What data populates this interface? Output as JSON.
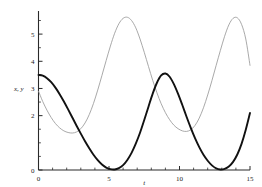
{
  "chart_data": {
    "type": "line",
    "title": "",
    "subtitle": "",
    "xlabel": "t",
    "ylabel": "x, y",
    "xlim": [
      0,
      15
    ],
    "ylim": [
      0,
      5.85
    ],
    "grid": false,
    "legend": null,
    "xticks": [
      0,
      5,
      10,
      15
    ],
    "xtick_labels": [
      "0",
      "5",
      "10",
      "15"
    ],
    "xminor_ticks": [
      1,
      2,
      3,
      4,
      6,
      7,
      8,
      9,
      11,
      12,
      13,
      14
    ],
    "yticks": [
      0,
      2,
      3,
      4,
      5
    ],
    "ytick_labels": [
      "0",
      "2",
      "3",
      "4",
      "5"
    ],
    "yminor_ticks": [
      0.5,
      1,
      1.5,
      2.5,
      3.5,
      4.5,
      5.5
    ],
    "series": [
      {
        "name": "x",
        "style": "bold-dark",
        "color": "#111111",
        "width": 1.9,
        "x": [
          0.0,
          0.3,
          0.6,
          0.9,
          1.2,
          1.5,
          1.8,
          2.1,
          2.4,
          2.7,
          3.0,
          3.3,
          3.6,
          3.9,
          4.2,
          4.5,
          4.8,
          5.1,
          5.4,
          5.7,
          6.0,
          6.3,
          6.6,
          6.9,
          7.2,
          7.5,
          7.8,
          8.1,
          8.4,
          8.7,
          9.0,
          9.3,
          9.6,
          9.9,
          10.2,
          10.5,
          10.8,
          11.1,
          11.4,
          11.7,
          12.0,
          12.3,
          12.6,
          12.9,
          13.2,
          13.5,
          13.8,
          14.1,
          14.4,
          14.7,
          15.0
        ],
        "y": [
          3.5,
          3.47,
          3.38,
          3.23,
          3.03,
          2.79,
          2.52,
          2.23,
          1.93,
          1.63,
          1.34,
          1.06,
          0.8,
          0.56,
          0.36,
          0.2,
          0.09,
          0.03,
          0.02,
          0.07,
          0.18,
          0.37,
          0.63,
          0.97,
          1.37,
          1.84,
          2.33,
          2.81,
          3.21,
          3.48,
          3.55,
          3.43,
          3.16,
          2.8,
          2.39,
          1.96,
          1.55,
          1.17,
          0.84,
          0.56,
          0.34,
          0.17,
          0.06,
          0.02,
          0.04,
          0.13,
          0.3,
          0.57,
          0.96,
          1.48,
          2.1
        ]
      },
      {
        "name": "y",
        "style": "thin-gray",
        "color": "#9a9a9a",
        "width": 0.85,
        "x": [
          0.0,
          0.3,
          0.6,
          0.9,
          1.2,
          1.5,
          1.8,
          2.1,
          2.4,
          2.7,
          3.0,
          3.3,
          3.6,
          3.9,
          4.2,
          4.5,
          4.8,
          5.1,
          5.4,
          5.7,
          6.0,
          6.3,
          6.6,
          6.9,
          7.2,
          7.5,
          7.8,
          8.1,
          8.4,
          8.7,
          9.0,
          9.3,
          9.6,
          9.9,
          10.2,
          10.5,
          10.8,
          11.1,
          11.4,
          11.7,
          12.0,
          12.3,
          12.6,
          12.9,
          13.2,
          13.5,
          13.8,
          14.1,
          14.4,
          14.7,
          15.0
        ],
        "y": [
          2.9,
          2.52,
          2.2,
          1.93,
          1.71,
          1.55,
          1.44,
          1.38,
          1.36,
          1.4,
          1.52,
          1.73,
          2.04,
          2.45,
          2.94,
          3.48,
          4.03,
          4.56,
          5.03,
          5.38,
          5.58,
          5.62,
          5.5,
          5.23,
          4.82,
          4.33,
          3.81,
          3.3,
          2.84,
          2.44,
          2.11,
          1.85,
          1.65,
          1.52,
          1.44,
          1.42,
          1.48,
          1.64,
          1.91,
          2.29,
          2.76,
          3.29,
          3.85,
          4.4,
          4.92,
          5.34,
          5.58,
          5.6,
          5.36,
          4.82,
          3.85
        ]
      }
    ]
  },
  "axes": {
    "x_axis_label": "t",
    "y_axis_label": "x, y"
  }
}
